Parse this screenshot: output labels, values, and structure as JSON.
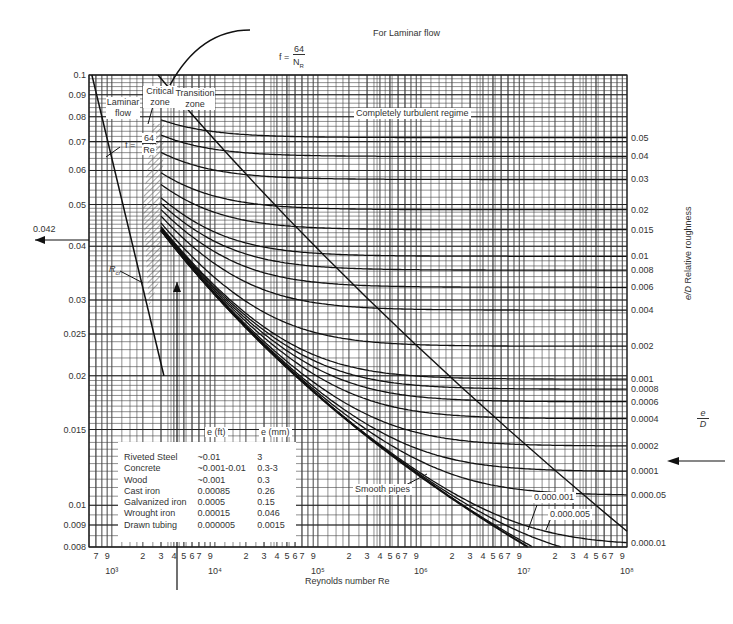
{
  "chart_data": {
    "type": "line",
    "xlabel": "Reynolds number Re",
    "ylabel": "Friction factor f",
    "right_axis_label": "e/D Relative roughness",
    "x_scale": "log",
    "y_scale": "log",
    "xlim": [
      600,
      100000000
    ],
    "ylim": [
      0.008,
      0.1
    ],
    "grid": true,
    "y_ticks": [
      "0.1",
      "0.09",
      "0.08",
      "0.07",
      "0.06",
      "0.05",
      "0.04",
      "0.03",
      "0.025",
      "0.02",
      "0.015",
      "0.01",
      "0.009",
      "0.008"
    ],
    "y_tick_values": [
      0.1,
      0.09,
      0.08,
      0.07,
      0.06,
      0.05,
      0.04,
      0.03,
      0.025,
      0.02,
      0.015,
      0.01,
      0.009,
      0.008
    ],
    "x_decade_labels": [
      "10³",
      "10⁴",
      "10⁵",
      "10⁶",
      "10⁷",
      "10⁸"
    ],
    "x_decade_values": [
      1000,
      10000,
      100000,
      1000000,
      10000000,
      100000000
    ],
    "x_minor_labels": [
      "2",
      "3",
      "4",
      "5",
      "6",
      "7",
      "9"
    ],
    "relative_roughness_labels": [
      "0.05",
      "0.04",
      "0.03",
      "0.02",
      "0.015",
      "0.01",
      "0.008",
      "0.006",
      "0.004",
      "0.002",
      "0.001",
      "0.0008",
      "0.0006",
      "0.0004",
      "0.0002",
      "0.0001",
      "0.000.05",
      "0.000.01"
    ],
    "series": [
      {
        "name": "Laminar f = 64/Re",
        "x": [
          640,
          2000,
          3200
        ],
        "y": [
          0.1,
          0.032,
          0.02
        ]
      },
      {
        "name": "e/D = 0.05",
        "x": [
          3000,
          10000,
          100000,
          100000000
        ],
        "y": [
          0.078,
          0.074,
          0.072,
          0.0716
        ]
      },
      {
        "name": "e/D = 0.04",
        "x": [
          3000,
          10000,
          100000,
          100000000
        ],
        "y": [
          0.073,
          0.069,
          0.066,
          0.065
        ]
      },
      {
        "name": "e/D = 0.03",
        "x": [
          3000,
          10000,
          100000,
          100000000
        ],
        "y": [
          0.068,
          0.063,
          0.059,
          0.0574
        ]
      },
      {
        "name": "e/D = 0.02",
        "x": [
          3000,
          10000,
          100000,
          100000000
        ],
        "y": [
          0.062,
          0.056,
          0.05,
          0.049
        ]
      },
      {
        "name": "e/D = 0.015",
        "x": [
          3000,
          10000,
          100000,
          100000000
        ],
        "y": [
          0.058,
          0.052,
          0.046,
          0.0438
        ]
      },
      {
        "name": "e/D = 0.01",
        "x": [
          3000,
          10000,
          100000,
          100000000
        ],
        "y": [
          0.054,
          0.047,
          0.04,
          0.0379
        ]
      },
      {
        "name": "e/D = 0.001",
        "x": [
          3000,
          10000,
          100000,
          1000000,
          100000000
        ],
        "y": [
          0.044,
          0.032,
          0.022,
          0.02,
          0.0196
        ]
      },
      {
        "name": "e/D = 0.0001",
        "x": [
          3000,
          10000,
          100000,
          1000000,
          100000000
        ],
        "y": [
          0.043,
          0.031,
          0.0185,
          0.0134,
          0.012
        ]
      },
      {
        "name": "e/D = 0.00001",
        "x": [
          3000,
          100000,
          1000000,
          10000000,
          100000000
        ],
        "y": [
          0.043,
          0.018,
          0.0117,
          0.009,
          0.0084
        ]
      },
      {
        "name": "Smooth pipes",
        "x": [
          3000,
          10000,
          100000,
          1000000,
          10000000
        ],
        "y": [
          0.043,
          0.031,
          0.018,
          0.0116,
          0.0081
        ]
      }
    ],
    "annotations": [
      "For Laminar flow f = 64/N_R",
      "Critical zone",
      "Transition zone",
      "Laminar flow",
      "f = 64/Re",
      "Completely turbulent regime",
      "R_cr",
      "0.042",
      "Smooth pipes",
      "0.000.001",
      "0.000.005",
      "e/D"
    ]
  },
  "labels": {
    "laminar_title": "For Laminar flow",
    "laminar_formula_num": "64",
    "laminar_formula_den": "N",
    "laminar_formula_sub": "R",
    "f_eq": "f =",
    "critical_zone": "Critical zone",
    "transition_zone": "Transition zone",
    "laminar_flow": "Laminar flow",
    "f64re_num": "64",
    "f64re_den": "Re",
    "turbulent": "Completely turbulent regime",
    "rcr": "R",
    "rcr_sub": "cr",
    "value_042": "0.042",
    "smooth": "Smooth pipes",
    "r1": "0.000.001",
    "r5": "0.000.005",
    "ed_num": "e",
    "ed_den": "D",
    "rel_rough": "Relative roughness",
    "xlabel": "Reynolds number Re"
  },
  "legend": {
    "header_ft": "e (ft)",
    "header_mm": "e (mm)",
    "rows": [
      {
        "material": "Riveted Steel",
        "ft": "~0.01",
        "mm": "3"
      },
      {
        "material": "Concrete",
        "ft": "~0.001-0.01",
        "mm": "0.3-3"
      },
      {
        "material": "Wood",
        "ft": "~0.001",
        "mm": "0.3"
      },
      {
        "material": "Cast iron",
        "ft": "0.00085",
        "mm": "0.26"
      },
      {
        "material": "Galvanized iron",
        "ft": "0.0005",
        "mm": "0.15"
      },
      {
        "material": "Wrought iron",
        "ft": "0.00015",
        "mm": "0.046"
      },
      {
        "material": "Drawn tubing",
        "ft": "0.000005",
        "mm": "0.0015"
      }
    ]
  }
}
